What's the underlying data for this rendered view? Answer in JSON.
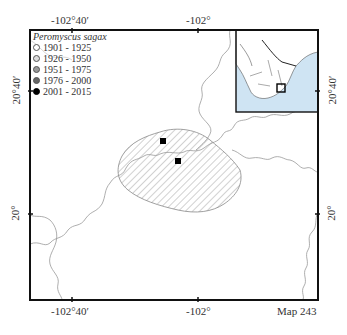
{
  "map": {
    "number_label": "Map 243",
    "species": "Peromyscus sagax",
    "top_axis": [
      "-102°40′",
      "-102°"
    ],
    "bottom_axis": [
      "-102°40′",
      "-102°"
    ],
    "left_axis": [
      "20°40′",
      "20°"
    ],
    "right_axis": [
      "20°40′",
      "20°"
    ]
  },
  "legend": {
    "title": "Peromyscus sagax",
    "items": [
      {
        "label": "1901 - 1925",
        "color": "#ffffff"
      },
      {
        "label": "1926 - 1950",
        "color": "#dddddd"
      },
      {
        "label": "1951 - 1975",
        "color": "#999999"
      },
      {
        "label": "1976 - 2000",
        "color": "#666666"
      },
      {
        "label": "2001 - 2015",
        "color": "#000000"
      }
    ]
  },
  "records": [
    {
      "period": "2001 - 2015",
      "x": 163,
      "y": 141
    },
    {
      "period": "2001 - 2015",
      "x": 178,
      "y": 161
    }
  ],
  "inset": {
    "content": "Mexico overview with study area marker",
    "water_color": "#cfe4f3"
  }
}
